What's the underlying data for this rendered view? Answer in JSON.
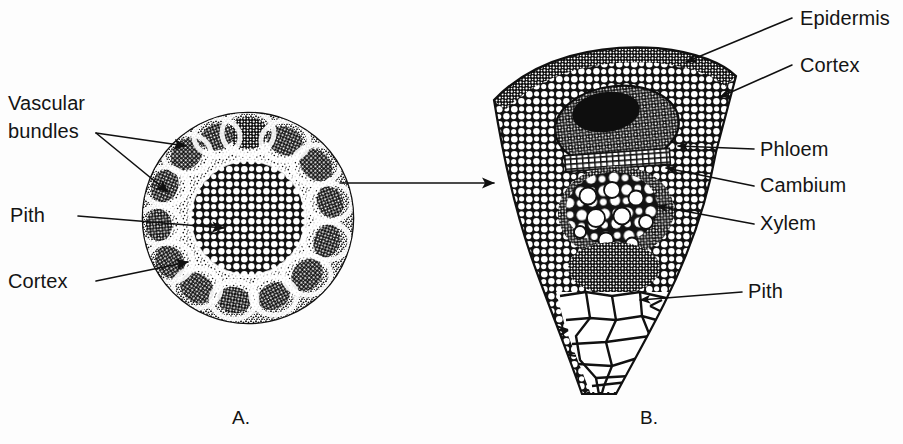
{
  "figure": {
    "background_color": "#fdfdfd",
    "ink_color": "#111111"
  },
  "panel_a": {
    "caption": "A.",
    "caption_x": 232,
    "caption_y": 424,
    "description": "Transverse section of a whole herbaceous stem showing a ring of vascular bundles",
    "center_x": 248,
    "center_y": 218,
    "radius": 106,
    "pith_radius": 57,
    "bundle_count": 14,
    "labels": [
      {
        "id": "vascular-bundles",
        "lines": [
          "Vascular",
          "bundles"
        ],
        "text_x": 8,
        "line1_y": 110,
        "line2_y": 138,
        "leader_start_x": 96,
        "leader_start_y": 133,
        "targets": [
          {
            "x": 186,
            "y": 146
          },
          {
            "x": 168,
            "y": 192
          }
        ]
      },
      {
        "id": "pith",
        "lines": [
          "Pith"
        ],
        "text_x": 10,
        "line1_y": 222,
        "leader_start_x": 78,
        "leader_start_y": 216,
        "targets": [
          {
            "x": 222,
            "y": 228
          }
        ]
      },
      {
        "id": "cortex",
        "lines": [
          "Cortex"
        ],
        "text_x": 8,
        "line1_y": 288,
        "leader_start_x": 96,
        "leader_start_y": 281,
        "targets": [
          {
            "x": 186,
            "y": 262
          }
        ]
      }
    ]
  },
  "connector": {
    "id": "a-to-b-arrow",
    "from_x": 340,
    "from_y": 183,
    "to_x": 496,
    "to_y": 183
  },
  "panel_b": {
    "caption": "B.",
    "caption_x": 640,
    "caption_y": 424,
    "description": "Enlarged wedge of the stem showing epidermis, cortex, phloem, cambium, xylem and pith",
    "labels": [
      {
        "id": "epidermis",
        "text": "Epidermis",
        "text_x": 800,
        "text_y": 25,
        "leader_start_x": 790,
        "leader_start_y": 18,
        "target_x": 684,
        "target_y": 62
      },
      {
        "id": "cortex",
        "text": "Cortex",
        "text_x": 800,
        "text_y": 72,
        "leader_start_x": 790,
        "leader_start_y": 65,
        "target_x": 718,
        "target_y": 97
      },
      {
        "id": "phloem",
        "text": "Phloem",
        "text_x": 760,
        "text_y": 156,
        "leader_start_x": 752,
        "leader_start_y": 149,
        "target_x": 676,
        "target_y": 146
      },
      {
        "id": "cambium",
        "text": "Cambium",
        "text_x": 760,
        "text_y": 192,
        "leader_start_x": 752,
        "leader_start_y": 186,
        "target_x": 664,
        "target_y": 168
      },
      {
        "id": "xylem",
        "text": "Xylem",
        "text_x": 760,
        "text_y": 230,
        "leader_start_x": 752,
        "leader_start_y": 224,
        "target_x": 655,
        "target_y": 205
      },
      {
        "id": "pith",
        "text": "Pith",
        "text_x": 748,
        "text_y": 298,
        "leader_start_x": 740,
        "leader_start_y": 292,
        "target_x": 638,
        "target_y": 300
      }
    ],
    "tissues": [
      {
        "name": "epidermis",
        "note": "dark band of small cells along the outer arc"
      },
      {
        "name": "cortex",
        "note": "rounded parenchyma cells beneath the epidermis"
      },
      {
        "name": "phloem",
        "note": "dark mass of small cells above the cambium"
      },
      {
        "name": "cambium",
        "note": "narrow band of flattened striped cells"
      },
      {
        "name": "xylem",
        "note": "region with large round vessel elements"
      },
      {
        "name": "pith",
        "note": "large polygonal cells at the inner taper"
      }
    ]
  }
}
